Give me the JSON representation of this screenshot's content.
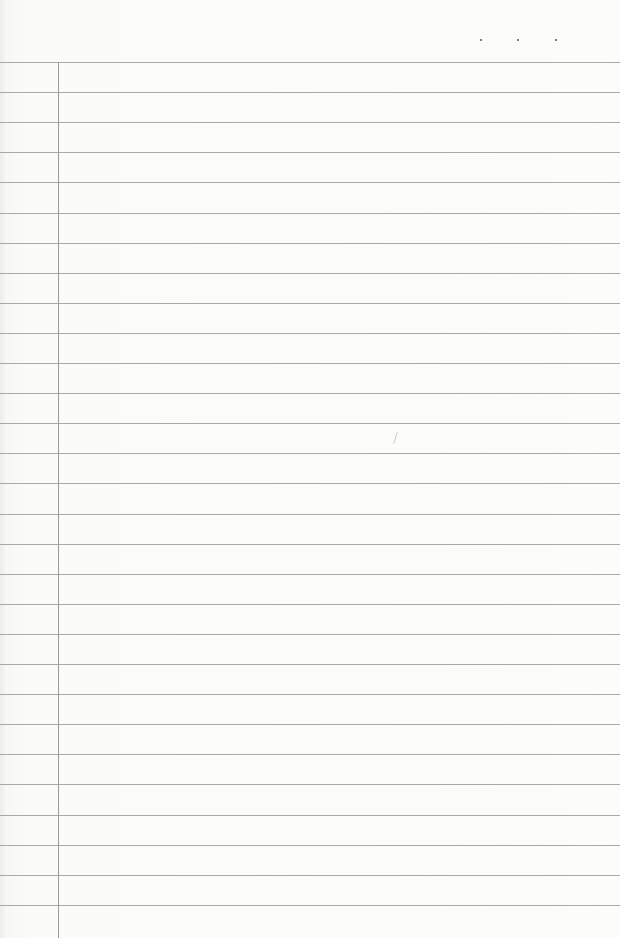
{
  "paper": {
    "type": "lined-notebook-page",
    "line_color": "#a9a9a9",
    "margin_color": "#9a9a9a",
    "background_color": "#fbfbfa",
    "first_line_y": 62,
    "line_spacing": 30.1,
    "line_count": 29,
    "margin_x": 58
  },
  "header_dots": [
    {
      "x": 481,
      "y": 40
    },
    {
      "x": 518,
      "y": 40
    },
    {
      "x": 556,
      "y": 40
    }
  ]
}
